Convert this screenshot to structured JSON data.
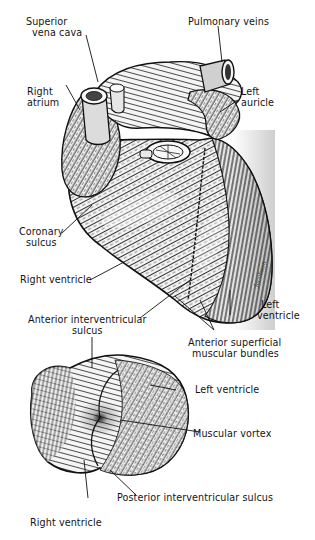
{
  "figure": {
    "upper_heart": {
      "labels": {
        "superior_vena_cava": [
          "Superior",
          "vena cava"
        ],
        "pulmonary_veins": "Pulmonary veins",
        "right_atrium": [
          "Right",
          "atrium"
        ],
        "left_auricle": [
          "Left",
          "auricle"
        ],
        "coronary_sulcus": [
          "Coronary",
          "sulcus"
        ],
        "right_ventricle": "Right ventricle",
        "left_ventricle": [
          "Left",
          "ventricle"
        ],
        "anterior_interventricular_sulcus": [
          "Anterior interventricular",
          "sulcus"
        ],
        "anterior_superficial_muscular_bundles": [
          "Anterior superficial",
          "muscular bundles"
        ]
      },
      "signature": "Jacobson"
    },
    "lower_heart": {
      "labels": {
        "left_ventricle": "Left ventricle",
        "muscular_vortex": "Muscular vortex",
        "posterior_interventricular_sulcus": "Posterior interventricular sulcus",
        "right_ventricle": "Right ventricle"
      }
    },
    "colors": {
      "ink": "#111111",
      "background": "#ffffff",
      "highlight": "#f2f2f2",
      "shade": "#4a4a4a"
    }
  }
}
